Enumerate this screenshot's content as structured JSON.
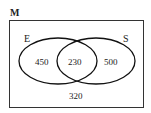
{
  "diagram": {
    "type": "venn",
    "universe_label": "M",
    "sets": [
      {
        "label": "E",
        "only_value": "450"
      },
      {
        "label": "S",
        "only_value": "500"
      }
    ],
    "intersection_value": "230",
    "outside_value": "320"
  }
}
